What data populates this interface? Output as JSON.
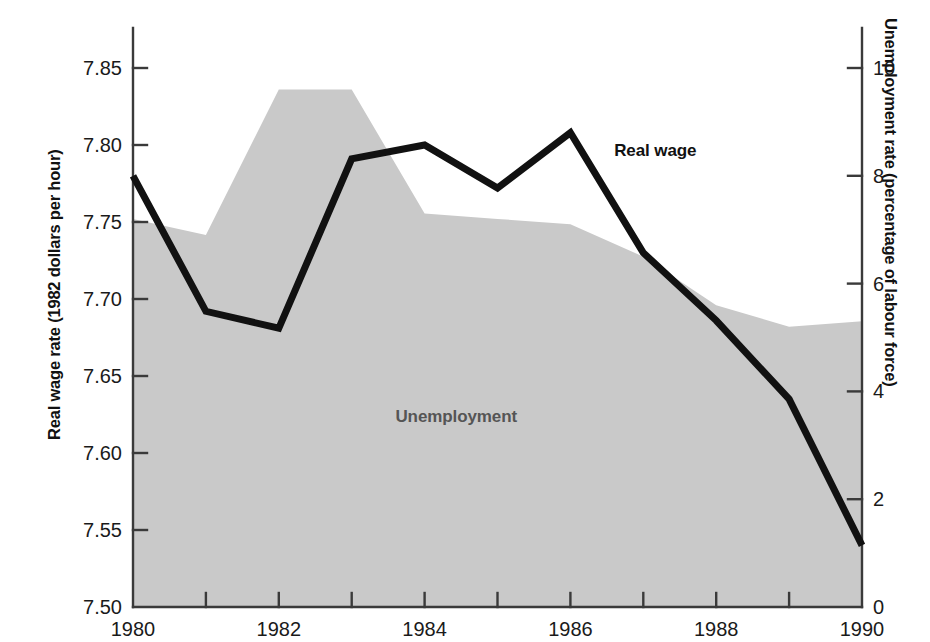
{
  "chart_data": {
    "type": "area",
    "title": "",
    "xlabel": "",
    "x": [
      1980,
      1981,
      1982,
      1983,
      1984,
      1985,
      1986,
      1987,
      1988,
      1989,
      1990
    ],
    "x_tick_labels": [
      "1980",
      "1982",
      "1984",
      "1986",
      "1988",
      "1990"
    ],
    "x_tick_values": [
      1980,
      1982,
      1984,
      1986,
      1988,
      1990
    ],
    "x_minor_ticks": [
      1981,
      1983,
      1985,
      1987,
      1989
    ],
    "xlim": [
      1980,
      1990
    ],
    "grid": false,
    "legend_position": "inline-annotation",
    "axes": [
      {
        "id": "left",
        "label": "Real wage rate (1982 dollars per hour)",
        "ylim": [
          7.5,
          7.85
        ],
        "tick_labels": [
          "7.50",
          "7.55",
          "7.60",
          "7.65",
          "7.70",
          "7.75",
          "7.80",
          "7.85"
        ],
        "tick_values": [
          7.5,
          7.55,
          7.6,
          7.65,
          7.7,
          7.75,
          7.8,
          7.85
        ]
      },
      {
        "id": "right",
        "label": "Unemployment rate (percentage of labour force)",
        "ylim": [
          0,
          10
        ],
        "tick_labels": [
          "0",
          "2",
          "4",
          "6",
          "8",
          "10"
        ],
        "tick_values": [
          0,
          2,
          4,
          6,
          8,
          10
        ]
      }
    ],
    "series": [
      {
        "name": "Unemployment",
        "axis": "right",
        "render": "area",
        "color": "#c9c9c9",
        "values": [
          7.2,
          6.9,
          9.6,
          9.6,
          7.3,
          7.2,
          7.1,
          6.5,
          5.6,
          5.2,
          5.3
        ]
      },
      {
        "name": "Real wage",
        "axis": "left",
        "render": "line",
        "color": "#111111",
        "values": [
          7.78,
          7.692,
          7.681,
          7.791,
          7.8,
          7.772,
          7.808,
          7.73,
          7.686,
          7.635,
          7.54
        ]
      }
    ],
    "annotations": [
      {
        "text": "Real wage",
        "x": 1986.6,
        "y_left": 7.797,
        "color": "#111111"
      },
      {
        "text": "Unemployment",
        "x": 1983.6,
        "y_right": 3.55,
        "color": "#555555"
      }
    ]
  }
}
